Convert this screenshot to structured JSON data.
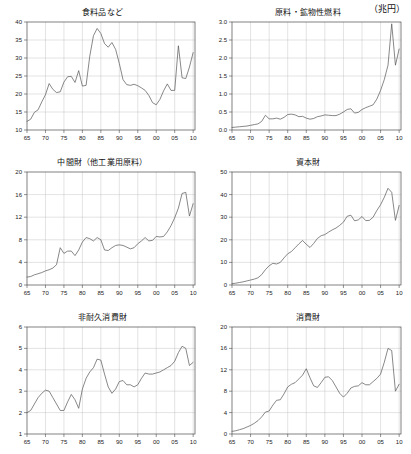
{
  "figure": {
    "unit_label": "（兆円）",
    "panel_count": 6
  },
  "chart_data": [
    {
      "id": "food",
      "type": "line",
      "title": "食料品など",
      "xlabel": "",
      "ylabel": "",
      "xlim": [
        65,
        110.5
      ],
      "ylim": [
        10,
        40
      ],
      "yticks": [
        10,
        15,
        20,
        25,
        30,
        35,
        40
      ],
      "ytick_labels": [
        "10",
        "15",
        "20",
        "25",
        "30",
        "35",
        "40"
      ],
      "xticks": [
        65,
        70,
        75,
        80,
        85,
        90,
        95,
        100,
        105,
        110
      ],
      "xtick_labels": [
        "65",
        "70",
        "75",
        "80",
        "85",
        "90",
        "95",
        "00",
        "05",
        "10"
      ],
      "grid": true,
      "x": [
        65,
        66,
        67,
        68,
        69,
        70,
        71,
        72,
        73,
        74,
        75,
        76,
        77,
        78,
        79,
        80,
        81,
        82,
        83,
        84,
        85,
        86,
        87,
        88,
        89,
        90,
        91,
        92,
        93,
        94,
        95,
        96,
        97,
        98,
        99,
        100,
        101,
        102,
        103,
        104,
        105,
        106,
        107,
        108,
        109,
        110
      ],
      "values": [
        12.4,
        13.0,
        14.9,
        15.6,
        17.8,
        19.8,
        22.9,
        21.3,
        20.4,
        20.6,
        23.3,
        24.8,
        24.9,
        23.2,
        26.5,
        22.2,
        22.4,
        30.5,
        36.2,
        38.2,
        36.8,
        34.0,
        33.0,
        34.3,
        32.4,
        28.5,
        24.0,
        22.6,
        22.4,
        22.7,
        22.3,
        21.7,
        21.0,
        19.6,
        17.6,
        17.0,
        18.5,
        20.9,
        22.8,
        21.0,
        21.0,
        33.4,
        24.5,
        24.3,
        27.5,
        31.5,
        35.0,
        38.6,
        35.2,
        38.3
      ]
    },
    {
      "id": "raw-materials-fuel",
      "type": "line",
      "title": "原料・鉱物性燃料",
      "xlabel": "",
      "ylabel": "",
      "xlim": [
        65,
        110.5
      ],
      "ylim": [
        0.0,
        3.0
      ],
      "yticks": [
        0.0,
        0.5,
        1.0,
        1.5,
        2.0,
        2.5,
        3.0
      ],
      "ytick_labels": [
        "0.0",
        "0.5",
        "1.0",
        "1.5",
        "2.0",
        "2.5",
        "3.0"
      ],
      "xticks": [
        65,
        70,
        75,
        80,
        85,
        90,
        95,
        100,
        105,
        110
      ],
      "xtick_labels": [
        "65",
        "70",
        "75",
        "80",
        "85",
        "90",
        "95",
        "00",
        "05",
        "10"
      ],
      "grid": true,
      "x": [
        65,
        66,
        67,
        68,
        69,
        70,
        71,
        72,
        73,
        74,
        75,
        76,
        77,
        78,
        79,
        80,
        81,
        82,
        83,
        84,
        85,
        86,
        87,
        88,
        89,
        90,
        91,
        92,
        93,
        94,
        95,
        96,
        97,
        98,
        99,
        100,
        101,
        102,
        103,
        104,
        105,
        106,
        107,
        108,
        109,
        110
      ],
      "values": [
        0.07,
        0.08,
        0.09,
        0.1,
        0.11,
        0.13,
        0.15,
        0.17,
        0.24,
        0.41,
        0.31,
        0.31,
        0.33,
        0.3,
        0.35,
        0.43,
        0.44,
        0.42,
        0.37,
        0.38,
        0.33,
        0.3,
        0.32,
        0.37,
        0.39,
        0.42,
        0.41,
        0.4,
        0.4,
        0.44,
        0.5,
        0.57,
        0.59,
        0.47,
        0.49,
        0.57,
        0.62,
        0.66,
        0.7,
        0.86,
        1.1,
        1.4,
        1.8,
        2.95,
        1.8,
        2.25
      ]
    },
    {
      "id": "intermediate-goods",
      "type": "line",
      "title": "中間財（他工業用原料）",
      "xlabel": "",
      "ylabel": "",
      "xlim": [
        65,
        110.5
      ],
      "ylim": [
        0,
        20
      ],
      "yticks": [
        0,
        4,
        8,
        12,
        16,
        20
      ],
      "ytick_labels": [
        "0",
        "4",
        "8",
        "12",
        "16",
        "20"
      ],
      "xticks": [
        65,
        70,
        75,
        80,
        85,
        90,
        95,
        100,
        105,
        110
      ],
      "xtick_labels": [
        "65",
        "70",
        "75",
        "80",
        "85",
        "90",
        "95",
        "00",
        "05",
        "10"
      ],
      "grid": true,
      "x": [
        65,
        66,
        67,
        68,
        69,
        70,
        71,
        72,
        73,
        74,
        75,
        76,
        77,
        78,
        79,
        80,
        81,
        82,
        83,
        84,
        85,
        86,
        87,
        88,
        89,
        90,
        91,
        92,
        93,
        94,
        95,
        96,
        97,
        98,
        99,
        100,
        101,
        102,
        103,
        104,
        105,
        106,
        107,
        108,
        109,
        110
      ],
      "values": [
        1.4,
        1.5,
        1.8,
        2.0,
        2.2,
        2.5,
        2.7,
        3.0,
        3.6,
        6.6,
        5.6,
        6.0,
        6.0,
        5.2,
        6.2,
        7.6,
        8.4,
        8.2,
        7.8,
        8.4,
        8.0,
        6.2,
        6.1,
        6.6,
        7.0,
        7.1,
        7.0,
        6.7,
        6.4,
        6.6,
        7.3,
        7.8,
        8.4,
        7.8,
        7.9,
        8.6,
        8.5,
        8.6,
        9.4,
        10.5,
        11.9,
        13.6,
        16.2,
        16.4,
        12.2,
        14.4
      ]
    },
    {
      "id": "capital-goods",
      "type": "line",
      "title": "資本財",
      "xlabel": "",
      "ylabel": "",
      "xlim": [
        65,
        110.5
      ],
      "ylim": [
        0,
        50
      ],
      "yticks": [
        0,
        10,
        20,
        30,
        40,
        50
      ],
      "ytick_labels": [
        "0",
        "10",
        "20",
        "30",
        "40",
        "50"
      ],
      "xticks": [
        65,
        70,
        75,
        80,
        85,
        90,
        95,
        100,
        105,
        110
      ],
      "xtick_labels": [
        "65",
        "70",
        "75",
        "80",
        "85",
        "90",
        "95",
        "00",
        "05",
        "10"
      ],
      "grid": true,
      "x": [
        65,
        66,
        67,
        68,
        69,
        70,
        71,
        72,
        73,
        74,
        75,
        76,
        77,
        78,
        79,
        80,
        81,
        82,
        83,
        84,
        85,
        86,
        87,
        88,
        89,
        90,
        91,
        92,
        93,
        94,
        95,
        96,
        97,
        98,
        99,
        100,
        101,
        102,
        103,
        104,
        105,
        106,
        107,
        108,
        109,
        110
      ],
      "values": [
        0.6,
        0.8,
        1.1,
        1.4,
        1.8,
        2.2,
        2.6,
        3.2,
        4.6,
        6.8,
        8.5,
        9.6,
        9.3,
        10.0,
        12.0,
        13.8,
        14.8,
        16.5,
        18.2,
        19.7,
        18.0,
        16.6,
        18.4,
        20.6,
        21.8,
        22.3,
        23.4,
        24.4,
        25.2,
        26.4,
        27.8,
        30.4,
        30.9,
        28.4,
        28.8,
        30.3,
        28.5,
        28.6,
        30.0,
        33.0,
        35.5,
        38.8,
        42.8,
        41.0,
        28.6,
        35.2
      ]
    },
    {
      "id": "nondurable-consumer-goods",
      "type": "line",
      "title": "非耐久消費財",
      "xlabel": "",
      "ylabel": "",
      "xlim": [
        65,
        110.5
      ],
      "ylim": [
        1,
        6
      ],
      "yticks": [
        1,
        2,
        3,
        4,
        5,
        6
      ],
      "ytick_labels": [
        "1",
        "2",
        "3",
        "4",
        "5",
        "6"
      ],
      "xticks": [
        65,
        70,
        75,
        80,
        85,
        90,
        95,
        100,
        105,
        110
      ],
      "xtick_labels": [
        "65",
        "70",
        "75",
        "80",
        "85",
        "90",
        "95",
        "00",
        "05",
        "10"
      ],
      "grid": true,
      "x": [
        65,
        66,
        67,
        68,
        69,
        70,
        71,
        72,
        73,
        74,
        75,
        76,
        77,
        78,
        79,
        80,
        81,
        82,
        83,
        84,
        85,
        86,
        87,
        88,
        89,
        90,
        91,
        92,
        93,
        94,
        95,
        96,
        97,
        98,
        99,
        100,
        101,
        102,
        103,
        104,
        105,
        106,
        107,
        108,
        109,
        110
      ],
      "values": [
        2.0,
        2.1,
        2.4,
        2.7,
        2.9,
        3.05,
        3.0,
        2.7,
        2.4,
        2.1,
        2.1,
        2.5,
        2.85,
        2.6,
        2.2,
        3.1,
        3.6,
        3.9,
        4.1,
        4.5,
        4.45,
        3.8,
        3.2,
        2.9,
        3.1,
        3.45,
        3.5,
        3.3,
        3.3,
        3.2,
        3.3,
        3.6,
        3.85,
        3.8,
        3.8,
        3.85,
        3.9,
        4.0,
        4.1,
        4.2,
        4.4,
        4.8,
        5.1,
        5.0,
        4.2,
        4.35
      ]
    },
    {
      "id": "consumer-goods",
      "type": "line",
      "title": "消費財",
      "xlabel": "",
      "ylabel": "",
      "xlim": [
        65,
        110.5
      ],
      "ylim": [
        0,
        20
      ],
      "yticks": [
        0,
        4,
        8,
        12,
        16,
        20
      ],
      "ytick_labels": [
        "0",
        "4",
        "8",
        "12",
        "16",
        "20"
      ],
      "xticks": [
        65,
        70,
        75,
        80,
        85,
        90,
        95,
        100,
        105,
        110
      ],
      "xtick_labels": [
        "65",
        "70",
        "75",
        "80",
        "85",
        "90",
        "95",
        "00",
        "05",
        "10"
      ],
      "grid": true,
      "x": [
        65,
        66,
        67,
        68,
        69,
        70,
        71,
        72,
        73,
        74,
        75,
        76,
        77,
        78,
        79,
        80,
        81,
        82,
        83,
        84,
        85,
        86,
        87,
        88,
        89,
        90,
        91,
        92,
        93,
        94,
        95,
        96,
        97,
        98,
        99,
        100,
        101,
        102,
        103,
        104,
        105,
        106,
        107,
        108,
        109,
        110
      ],
      "values": [
        0.5,
        0.6,
        0.8,
        1.0,
        1.3,
        1.6,
        2.0,
        2.5,
        3.2,
        4.1,
        4.3,
        5.4,
        6.3,
        6.4,
        7.5,
        8.8,
        9.3,
        9.6,
        10.3,
        11.0,
        12.2,
        10.5,
        9.0,
        8.7,
        9.6,
        10.6,
        10.7,
        10.0,
        8.8,
        7.6,
        6.9,
        7.6,
        8.6,
        8.9,
        9.0,
        9.6,
        9.2,
        9.2,
        9.8,
        10.4,
        11.2,
        13.4,
        16.0,
        15.6,
        8.0,
        9.3
      ]
    }
  ]
}
